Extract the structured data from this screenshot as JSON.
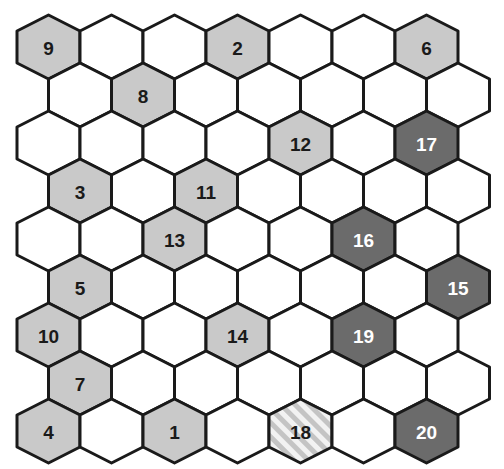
{
  "grid": {
    "rows": 9,
    "cols": 7,
    "hex_width": 63,
    "row_step": 48,
    "origin_x": 17,
    "origin_y": 15,
    "odd_row_offset": 31.5
  },
  "colors": {
    "empty": "#ffffff",
    "light": "#c9c9c9",
    "dark": "#6b6b6b",
    "hatch_a": "#c4c4c4",
    "hatch_b": "#f2f2f2",
    "stroke": "#1a1a1a",
    "text_dark": "#1a1a1a",
    "text_light": "#ffffff"
  },
  "cells": [
    {
      "label": "9",
      "row": 0,
      "col": 0,
      "style": "light"
    },
    {
      "label": "2",
      "row": 0,
      "col": 3,
      "style": "light"
    },
    {
      "label": "6",
      "row": 0,
      "col": 6,
      "style": "light"
    },
    {
      "label": "8",
      "row": 1,
      "col": 1,
      "style": "light"
    },
    {
      "label": "12",
      "row": 2,
      "col": 4,
      "style": "light"
    },
    {
      "label": "17",
      "row": 2,
      "col": 6,
      "style": "dark"
    },
    {
      "label": "3",
      "row": 3,
      "col": 0,
      "style": "light"
    },
    {
      "label": "11",
      "row": 3,
      "col": 2,
      "style": "light"
    },
    {
      "label": "13",
      "row": 4,
      "col": 2,
      "style": "light"
    },
    {
      "label": "16",
      "row": 4,
      "col": 5,
      "style": "dark"
    },
    {
      "label": "5",
      "row": 5,
      "col": 0,
      "style": "light"
    },
    {
      "label": "15",
      "row": 5,
      "col": 6,
      "style": "dark"
    },
    {
      "label": "10",
      "row": 6,
      "col": 0,
      "style": "light"
    },
    {
      "label": "14",
      "row": 6,
      "col": 3,
      "style": "light"
    },
    {
      "label": "19",
      "row": 6,
      "col": 5,
      "style": "dark"
    },
    {
      "label": "7",
      "row": 7,
      "col": 0,
      "style": "light"
    },
    {
      "label": "4",
      "row": 8,
      "col": 0,
      "style": "light"
    },
    {
      "label": "1",
      "row": 8,
      "col": 2,
      "style": "light"
    },
    {
      "label": "18",
      "row": 8,
      "col": 4,
      "style": "hatched"
    },
    {
      "label": "20",
      "row": 8,
      "col": 6,
      "style": "dark"
    }
  ]
}
